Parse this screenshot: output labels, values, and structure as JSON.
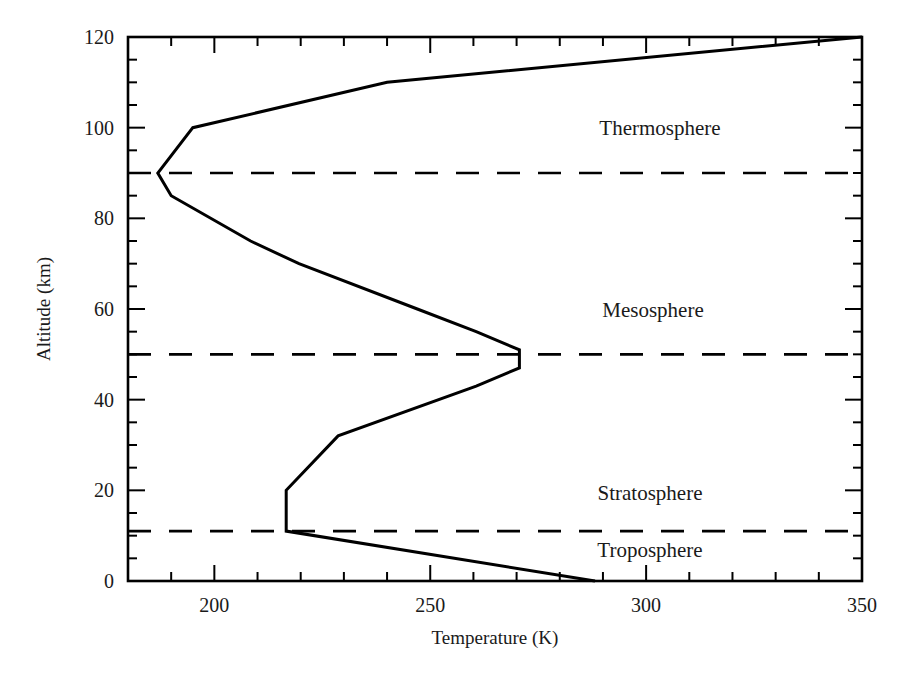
{
  "chart_data": {
    "type": "line",
    "title": "",
    "xlabel": "Temperature (K)",
    "ylabel": "Altitude (km)",
    "xlim": [
      180,
      350
    ],
    "ylim": [
      0,
      120
    ],
    "x_major_ticks": [
      200,
      250,
      300,
      350
    ],
    "x_minor_step": 10,
    "y_major_ticks": [
      0,
      20,
      40,
      60,
      80,
      100,
      120
    ],
    "y_minor_step": 5,
    "grid": false,
    "legend": null,
    "series": [
      {
        "name": "Temperature profile",
        "x": [
          288.15,
          216.65,
          216.65,
          228.65,
          260.65,
          270.65,
          270.65,
          260.65,
          247.0,
          219.6,
          208.4,
          190.0,
          186.9,
          195.0,
          240.0,
          350.0
        ],
        "y": [
          0,
          11,
          20,
          32,
          43,
          47,
          51,
          55,
          60,
          70,
          75,
          85,
          90,
          100,
          110,
          120
        ],
        "style": "solid",
        "color": "#000000"
      }
    ],
    "boundaries": [
      {
        "name": "Tropopause",
        "altitude": 11,
        "style": "dashed"
      },
      {
        "name": "Stratopause",
        "altitude": 50,
        "style": "dashed"
      },
      {
        "name": "Mesopause",
        "altitude": 90,
        "style": "dashed"
      }
    ],
    "annotations": [
      {
        "text": "Thermosphere",
        "x": 300,
        "y": 100
      },
      {
        "text": "Mesosphere",
        "x": 300,
        "y": 60
      },
      {
        "text": "Stratosphere",
        "x": 300,
        "y": 20
      },
      {
        "text": "Troposphere",
        "x": 300,
        "y": 7
      }
    ]
  }
}
